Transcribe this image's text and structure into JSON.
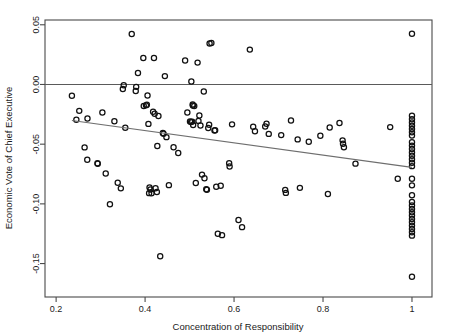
{
  "chart_data": {
    "type": "scatter",
    "title": "",
    "xlabel": "Concentration of Responsibility",
    "ylabel": "Economic Vote of Chief Executive",
    "xlim": [
      0.175,
      1.045
    ],
    "ylim": [
      -0.178,
      0.054
    ],
    "xticks": [
      0.2,
      0.4,
      0.6,
      0.8,
      1
    ],
    "xticklabels": [
      "0.2",
      "0.4",
      "0.6",
      "0.8",
      "1"
    ],
    "yticks": [
      0.05,
      0.0,
      -0.05,
      -0.1,
      -0.15
    ],
    "yticklabels": [
      "0.05",
      "0.00",
      "-0.05",
      "-0.10",
      "-0.15"
    ],
    "grid": false,
    "legend": null,
    "marker": "open-circle",
    "marker_color": "#111111",
    "annotations": [
      {
        "name": "zero-reference-line",
        "type": "hline",
        "y": 0.0,
        "color": "#5a5a5a"
      },
      {
        "name": "regression-line",
        "type": "line",
        "x0": 0.2355,
        "y0": -0.0302,
        "x1": 1.0,
        "y1": -0.0694,
        "color": "#6e6e6e"
      }
    ],
    "points": [
      [
        0.2355,
        -0.0094
      ],
      [
        0.2455,
        -0.0295
      ],
      [
        0.252,
        -0.0221
      ],
      [
        0.264,
        -0.0527
      ],
      [
        0.27,
        -0.063
      ],
      [
        0.2705,
        -0.0285
      ],
      [
        0.293,
        -0.066
      ],
      [
        0.2935,
        -0.0664
      ],
      [
        0.304,
        -0.0235
      ],
      [
        0.3115,
        -0.0745
      ],
      [
        0.321,
        -0.1003
      ],
      [
        0.331,
        -0.0308
      ],
      [
        0.3385,
        -0.0823
      ],
      [
        0.3455,
        -0.087
      ],
      [
        0.35,
        -0.0038
      ],
      [
        0.352,
        -0.0006
      ],
      [
        0.3555,
        -0.0362
      ],
      [
        0.37,
        0.0422
      ],
      [
        0.379,
        -0.0055
      ],
      [
        0.38,
        -0.002
      ],
      [
        0.384,
        0.0096
      ],
      [
        0.396,
        0.0222
      ],
      [
        0.397,
        -0.018
      ],
      [
        0.402,
        -0.0175
      ],
      [
        0.404,
        -0.0169
      ],
      [
        0.4055,
        -0.0093
      ],
      [
        0.4075,
        -0.033
      ],
      [
        0.409,
        -0.091
      ],
      [
        0.41,
        -0.0862
      ],
      [
        0.412,
        -0.0879
      ],
      [
        0.4145,
        -0.0911
      ],
      [
        0.418,
        -0.0228
      ],
      [
        0.42,
        0.0221
      ],
      [
        0.4215,
        -0.0245
      ],
      [
        0.4235,
        -0.0869
      ],
      [
        0.4265,
        -0.09
      ],
      [
        0.4275,
        -0.0515
      ],
      [
        0.43,
        -0.0264
      ],
      [
        0.434,
        -0.1439
      ],
      [
        0.44,
        -0.0407
      ],
      [
        0.4415,
        -0.0412
      ],
      [
        0.4445,
        0.007
      ],
      [
        0.448,
        -0.0441
      ],
      [
        0.4535,
        -0.0843
      ],
      [
        0.464,
        -0.0525
      ],
      [
        0.4745,
        -0.0574
      ],
      [
        0.49,
        0.02
      ],
      [
        0.495,
        -0.0235
      ],
      [
        0.501,
        -0.031
      ],
      [
        0.5035,
        -0.0315
      ],
      [
        0.504,
        0.0025
      ],
      [
        0.506,
        -0.0311
      ],
      [
        0.507,
        -0.0168
      ],
      [
        0.5075,
        -0.0176
      ],
      [
        0.508,
        -0.034
      ],
      [
        0.5105,
        -0.0181
      ],
      [
        0.514,
        -0.0825
      ],
      [
        0.518,
        0.0183
      ],
      [
        0.52,
        -0.0305
      ],
      [
        0.522,
        -0.026
      ],
      [
        0.5245,
        -0.0343
      ],
      [
        0.528,
        -0.0755
      ],
      [
        0.532,
        -0.0059
      ],
      [
        0.5335,
        -0.0785
      ],
      [
        0.5375,
        -0.0878
      ],
      [
        0.539,
        -0.0882
      ],
      [
        0.542,
        -0.0364
      ],
      [
        0.544,
        -0.0338
      ],
      [
        0.545,
        0.0344
      ],
      [
        0.549,
        0.0347
      ],
      [
        0.556,
        -0.0385
      ],
      [
        0.5575,
        -0.0383
      ],
      [
        0.56,
        -0.0856
      ],
      [
        0.5635,
        -0.1251
      ],
      [
        0.57,
        -0.0848
      ],
      [
        0.573,
        -0.1262
      ],
      [
        0.589,
        -0.066
      ],
      [
        0.59,
        -0.0687
      ],
      [
        0.5955,
        -0.0334
      ],
      [
        0.61,
        -0.1135
      ],
      [
        0.618,
        -0.1195
      ],
      [
        0.6355,
        0.0292
      ],
      [
        0.643,
        -0.0354
      ],
      [
        0.647,
        -0.0392
      ],
      [
        0.67,
        -0.0352
      ],
      [
        0.673,
        -0.0329
      ],
      [
        0.678,
        -0.0414
      ],
      [
        0.706,
        -0.0424
      ],
      [
        0.715,
        -0.0883
      ],
      [
        0.7165,
        -0.0908
      ],
      [
        0.728,
        -0.0301
      ],
      [
        0.743,
        -0.046
      ],
      [
        0.748,
        -0.0866
      ],
      [
        0.768,
        -0.0479
      ],
      [
        0.794,
        -0.043
      ],
      [
        0.811,
        -0.0918
      ],
      [
        0.815,
        -0.0361
      ],
      [
        0.837,
        -0.0323
      ],
      [
        0.844,
        -0.0468
      ],
      [
        0.845,
        -0.0497
      ],
      [
        0.847,
        -0.0526
      ],
      [
        0.873,
        -0.0663
      ],
      [
        0.951,
        -0.0357
      ],
      [
        0.968,
        -0.0789
      ],
      [
        1.0,
        0.0424
      ],
      [
        1.0,
        -0.0261
      ],
      [
        1.0,
        -0.0291
      ],
      [
        1.0,
        -0.0318
      ],
      [
        1.0,
        -0.0345
      ],
      [
        1.0,
        -0.0372
      ],
      [
        1.0,
        -0.04
      ],
      [
        1.0,
        -0.0427
      ],
      [
        1.0,
        -0.0484
      ],
      [
        1.0,
        -0.0512
      ],
      [
        1.0,
        -0.0541
      ],
      [
        1.0,
        -0.057
      ],
      [
        1.0,
        -0.0597
      ],
      [
        1.0,
        -0.0626
      ],
      [
        1.0,
        -0.0655
      ],
      [
        1.0,
        -0.0684
      ],
      [
        1.0,
        -0.079
      ],
      [
        1.0,
        -0.0845
      ],
      [
        1.0,
        -0.0928
      ],
      [
        1.0,
        -0.0985
      ],
      [
        1.0,
        -0.1014
      ],
      [
        1.0,
        -0.1042
      ],
      [
        1.0,
        -0.107
      ],
      [
        1.0,
        -0.1098
      ],
      [
        1.0,
        -0.1126
      ],
      [
        1.0,
        -0.1154
      ],
      [
        1.0,
        -0.1182
      ],
      [
        1.0,
        -0.121
      ],
      [
        1.0,
        -0.1238
      ],
      [
        1.0,
        -0.1266
      ],
      [
        1.0,
        -0.161
      ]
    ]
  }
}
